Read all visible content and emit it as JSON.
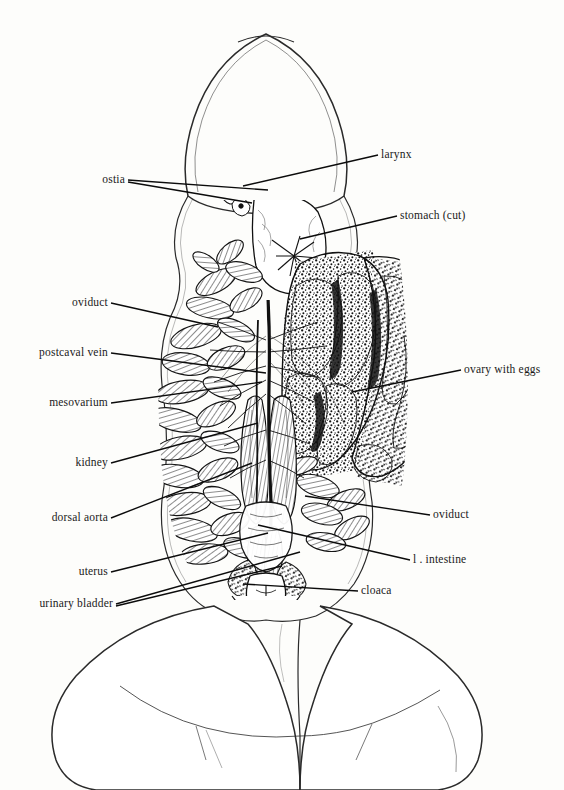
{
  "figure": {
    "background_color": "#fdfdfb",
    "ink_color": "#111111",
    "width": 564,
    "height": 790
  },
  "labels": [
    {
      "id": "larynx",
      "text": "larynx",
      "side": "right",
      "x": 381,
      "y": 155,
      "leaders": [
        {
          "x1": 378,
          "y1": 155,
          "x2": 243,
          "y2": 186
        }
      ]
    },
    {
      "id": "ostia",
      "text": "ostia",
      "side": "left",
      "x": 125,
      "y": 180,
      "leaders": [
        {
          "x1": 128,
          "y1": 180,
          "x2": 268,
          "y2": 190
        },
        {
          "x1": 128,
          "y1": 182,
          "x2": 252,
          "y2": 203
        }
      ]
    },
    {
      "id": "stomach-cut",
      "text": "stomach (cut)",
      "side": "right",
      "x": 400,
      "y": 216,
      "leaders": [
        {
          "x1": 397,
          "y1": 216,
          "x2": 300,
          "y2": 239
        }
      ]
    },
    {
      "id": "oviduct-left",
      "text": "oviduct",
      "side": "left",
      "x": 108,
      "y": 303,
      "leaders": [
        {
          "x1": 111,
          "y1": 303,
          "x2": 218,
          "y2": 327
        }
      ]
    },
    {
      "id": "postcaval-vein",
      "text": "postcaval vein",
      "side": "left",
      "x": 108,
      "y": 353,
      "leaders": [
        {
          "x1": 111,
          "y1": 353,
          "x2": 266,
          "y2": 373
        }
      ]
    },
    {
      "id": "ovary-with-eggs",
      "text": "ovary with eggs",
      "side": "right",
      "x": 464,
      "y": 370,
      "leaders": [
        {
          "x1": 461,
          "y1": 370,
          "x2": 352,
          "y2": 392
        }
      ]
    },
    {
      "id": "mesovarium",
      "text": "mesovarium",
      "side": "left",
      "x": 108,
      "y": 403,
      "leaders": [
        {
          "x1": 111,
          "y1": 403,
          "x2": 262,
          "y2": 382
        }
      ]
    },
    {
      "id": "kidney",
      "text": "kidney",
      "side": "left",
      "x": 108,
      "y": 463,
      "leaders": [
        {
          "x1": 111,
          "y1": 463,
          "x2": 258,
          "y2": 423
        }
      ]
    },
    {
      "id": "dorsal-aorta",
      "text": "dorsal aorta",
      "side": "left",
      "x": 108,
      "y": 518,
      "leaders": [
        {
          "x1": 111,
          "y1": 518,
          "x2": 252,
          "y2": 463
        }
      ]
    },
    {
      "id": "oviduct-right",
      "text": "oviduct",
      "side": "right",
      "x": 433,
      "y": 515,
      "leaders": [
        {
          "x1": 430,
          "y1": 515,
          "x2": 305,
          "y2": 496
        }
      ]
    },
    {
      "id": "uterus",
      "text": "uterus",
      "side": "left",
      "x": 108,
      "y": 572,
      "leaders": [
        {
          "x1": 111,
          "y1": 572,
          "x2": 268,
          "y2": 533
        }
      ]
    },
    {
      "id": "l-intestine",
      "text": "l . intestine",
      "side": "right",
      "x": 413,
      "y": 560,
      "leaders": [
        {
          "x1": 410,
          "y1": 560,
          "x2": 258,
          "y2": 525
        }
      ]
    },
    {
      "id": "cloaca",
      "text": "cloaca",
      "side": "right",
      "x": 361,
      "y": 591,
      "leaders": [
        {
          "x1": 358,
          "y1": 591,
          "x2": 243,
          "y2": 584
        }
      ]
    },
    {
      "id": "urinary-bladder",
      "text": "urinary bladder",
      "side": "left",
      "x": 113,
      "y": 604,
      "leaders": [
        {
          "x1": 116,
          "y1": 604,
          "x2": 300,
          "y2": 552
        },
        {
          "x1": 116,
          "y1": 606,
          "x2": 282,
          "y2": 566
        }
      ]
    }
  ],
  "anatomy_notes": {
    "view": "ventral",
    "organism": "frog (female)",
    "structures_shown": [
      "head outline",
      "larynx",
      "stomach (cut)",
      "ostia",
      "coiled oviducts",
      "ovary with eggs",
      "kidney",
      "postcaval vein",
      "dorsal aorta",
      "mesovarium",
      "uterus",
      "urinary bladder",
      "large intestine",
      "cloaca",
      "hind limb thighs"
    ]
  }
}
